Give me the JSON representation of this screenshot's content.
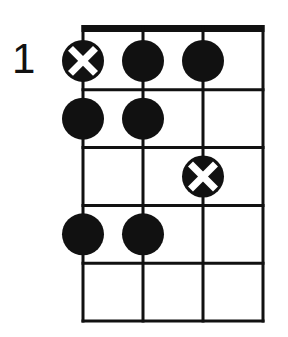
{
  "diagram": {
    "type": "fretboard-scale-diagram",
    "start_fret_label": "1",
    "strings": 4,
    "frets": 5,
    "colors": {
      "line": "#111111",
      "dot": "#111111",
      "root_mark": "#ffffff",
      "background": "#ffffff"
    },
    "notes": [
      {
        "string": 1,
        "fret": 1,
        "root": true
      },
      {
        "string": 2,
        "fret": 1,
        "root": false
      },
      {
        "string": 3,
        "fret": 1,
        "root": false
      },
      {
        "string": 1,
        "fret": 2,
        "root": false
      },
      {
        "string": 2,
        "fret": 2,
        "root": false
      },
      {
        "string": 3,
        "fret": 3,
        "root": true
      },
      {
        "string": 1,
        "fret": 4,
        "root": false
      },
      {
        "string": 2,
        "fret": 4,
        "root": false
      }
    ]
  }
}
